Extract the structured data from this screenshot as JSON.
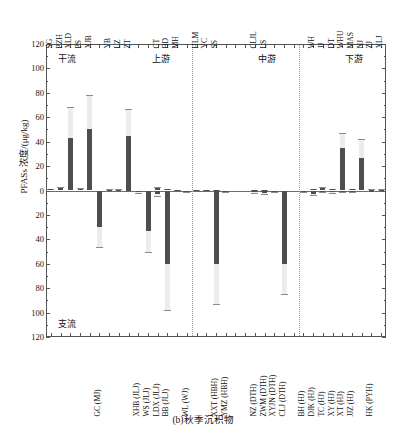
{
  "figure": {
    "caption": "(b)秋季沉积物",
    "y_axis_title": "PFASs 浓度/(μg/kg)"
  },
  "regions": {
    "mainstem_label": "干流",
    "tributary_label": "支流",
    "upper_label": "上游",
    "middle_label": "中游",
    "lower_label": "下游"
  },
  "axis": {
    "y_ticks_up": [
      "120",
      "100",
      "80",
      "60",
      "40",
      "20",
      "0"
    ],
    "y_ticks_down": [
      "20",
      "40",
      "60",
      "80",
      "100",
      "120"
    ],
    "y_all_ticks": [
      "120",
      "100",
      "80",
      "60",
      "40",
      "20",
      "0",
      "20",
      "40",
      "60",
      "80",
      "100",
      "120"
    ],
    "ylim": [
      -120,
      120
    ],
    "n_positions": 34
  },
  "chart_data": {
    "type": "bar",
    "title": "(b)秋季沉积物",
    "xlabel": "",
    "ylabel": "PFASs 浓度/(μg/kg)",
    "ylim": [
      -120,
      120
    ],
    "grid": false,
    "legend": "none",
    "orientation": "vertical-diverging",
    "note": "Positive bars plot upward (mainstem 干流 sites, labelled along the top axis); negative bars plot downward (tributary 支流 sites, labelled along the bottom axis). Light grey extensions are error bars.",
    "top_axis_labels": [
      "SG",
      "PZH",
      "XLD",
      "PS",
      "XJB",
      "YB",
      "LZ",
      "ZT",
      "CT",
      "BD",
      "MH",
      "HLM",
      "YC",
      "SS",
      "CLJL",
      "LS",
      "WH",
      "JJ",
      "DT",
      "WHU",
      "MAS",
      "NJ",
      "ZJ",
      "XLJ"
    ],
    "bottom_axis_labels": [
      "GC (MJ)",
      "XHB (JLJ)",
      "WS (JLJ)",
      "LDX (JLJ)",
      "BB (JLJ)",
      "WL (WJ)",
      "XXT (HBH)",
      "YMZ (HBH)",
      "NZ (DTH)",
      "ZWM (DTH)",
      "XYJN (DTH)",
      "CLJ (DTH)",
      "BH (HJ)",
      "DJK (HJ)",
      "TC (HJ)",
      "XY (HJ)",
      "XT (HJ)",
      "JJZ (HJ)",
      "HK (PYH)"
    ],
    "series": [
      {
        "name": "干流 (mainstem, positive)",
        "points": [
          {
            "site": "SG",
            "pos": 1,
            "value": 1.0,
            "err_hi": 1.5
          },
          {
            "site": "PZH",
            "pos": 2,
            "value": 2.0,
            "err_hi": 3.0
          },
          {
            "site": "XLD",
            "pos": 3,
            "value": 43.0,
            "err_hi": 68.0
          },
          {
            "site": "PS",
            "pos": 4,
            "value": 1.5,
            "err_hi": 2.0
          },
          {
            "site": "XJB",
            "pos": 5,
            "value": 50.0,
            "err_hi": 78.0
          },
          {
            "site": "YB",
            "pos": 7,
            "value": 0.8,
            "err_hi": 1.2
          },
          {
            "site": "LZ",
            "pos": 8,
            "value": 0.6,
            "err_hi": 1.0
          },
          {
            "site": "ZT",
            "pos": 9,
            "value": 45.0,
            "err_hi": 67.0
          },
          {
            "site": "CT",
            "pos": 12,
            "value": 2.2,
            "err_hi": 3.2
          },
          {
            "site": "BD",
            "pos": 13,
            "value": 1.0,
            "err_hi": 1.4
          },
          {
            "site": "MH",
            "pos": 14,
            "value": 0.5,
            "err_hi": 0.8
          },
          {
            "site": "HLM",
            "pos": 16,
            "value": 0.4,
            "err_hi": 0.6
          },
          {
            "site": "YC",
            "pos": 17,
            "value": 0.5,
            "err_hi": 0.7
          },
          {
            "site": "SS",
            "pos": 18,
            "value": 0.4,
            "err_hi": 0.6
          },
          {
            "site": "CLJL",
            "pos": 22,
            "value": 0.5,
            "err_hi": 0.7
          },
          {
            "site": "LS",
            "pos": 23,
            "value": 0.4,
            "err_hi": 0.6
          },
          {
            "site": "WH",
            "pos": 28,
            "value": 1.0,
            "err_hi": 1.4
          },
          {
            "site": "JJ",
            "pos": 29,
            "value": 2.0,
            "err_hi": 3.0
          },
          {
            "site": "DT",
            "pos": 30,
            "value": 1.2,
            "err_hi": 1.6
          },
          {
            "site": "WHU",
            "pos": 31,
            "value": 35.0,
            "err_hi": 47.0
          },
          {
            "site": "MAS",
            "pos": 32,
            "value": 1.0,
            "err_hi": 1.5
          },
          {
            "site": "NJ",
            "pos": 33,
            "value": 27.0,
            "err_hi": 42.0
          },
          {
            "site": "ZJ",
            "pos": 34,
            "value": 0.8,
            "err_hi": 1.2
          },
          {
            "site": "XLJ",
            "pos": 35,
            "value": 0.6,
            "err_hi": 0.9
          }
        ]
      },
      {
        "name": "支流 (tributary, negative)",
        "points": [
          {
            "site": "GC (MJ)",
            "pos": 6,
            "value": -30.0,
            "err_lo": -46.0
          },
          {
            "site": "XHB (JLJ)",
            "pos": 10,
            "value": -1.5,
            "err_lo": -2.2
          },
          {
            "site": "WS (JLJ)",
            "pos": 11,
            "value": -33.0,
            "err_lo": -50.0
          },
          {
            "site": "LDX (JLJ)",
            "pos": 12,
            "value": -3.0,
            "err_lo": -4.5
          },
          {
            "site": "BB (JLJ)",
            "pos": 13,
            "value": -60.0,
            "err_lo": -98.0
          },
          {
            "site": "WL (WJ)",
            "pos": 15,
            "value": -1.0,
            "err_lo": -1.5
          },
          {
            "site": "XXT (HBH)",
            "pos": 18,
            "value": -60.0,
            "err_lo": -93.0
          },
          {
            "site": "YMZ (HBH)",
            "pos": 19,
            "value": -1.0,
            "err_lo": -1.5
          },
          {
            "site": "NZ (DTH)",
            "pos": 22,
            "value": -1.5,
            "err_lo": -2.2
          },
          {
            "site": "ZWM (DTH)",
            "pos": 23,
            "value": -1.8,
            "err_lo": -2.6
          },
          {
            "site": "XYJN (DTH)",
            "pos": 24,
            "value": -1.0,
            "err_lo": -1.5
          },
          {
            "site": "CLJ (DTH)",
            "pos": 25,
            "value": -60.0,
            "err_lo": -85.0
          },
          {
            "site": "BH (HJ)",
            "pos": 27,
            "value": -0.8,
            "err_lo": -1.2
          },
          {
            "site": "DJK (HJ)",
            "pos": 28,
            "value": -2.5,
            "err_lo": -3.5
          },
          {
            "site": "TC (HJ)",
            "pos": 29,
            "value": -1.0,
            "err_lo": -1.5
          },
          {
            "site": "XY (HJ)",
            "pos": 30,
            "value": -1.2,
            "err_lo": -1.8
          },
          {
            "site": "XT (HJ)",
            "pos": 31,
            "value": -0.8,
            "err_lo": -1.2
          },
          {
            "site": "JJZ (HJ)",
            "pos": 32,
            "value": -0.6,
            "err_lo": -1.0
          },
          {
            "site": "HK (PYH)",
            "pos": 34,
            "value": -0.5,
            "err_lo": -0.8
          }
        ]
      }
    ],
    "region_dividers_after_position": [
      15,
      26
    ],
    "colors": {
      "bar": "#4e4e4e",
      "error": "#ececec",
      "axis": "#555555",
      "divider": "#9a9a9a"
    }
  }
}
